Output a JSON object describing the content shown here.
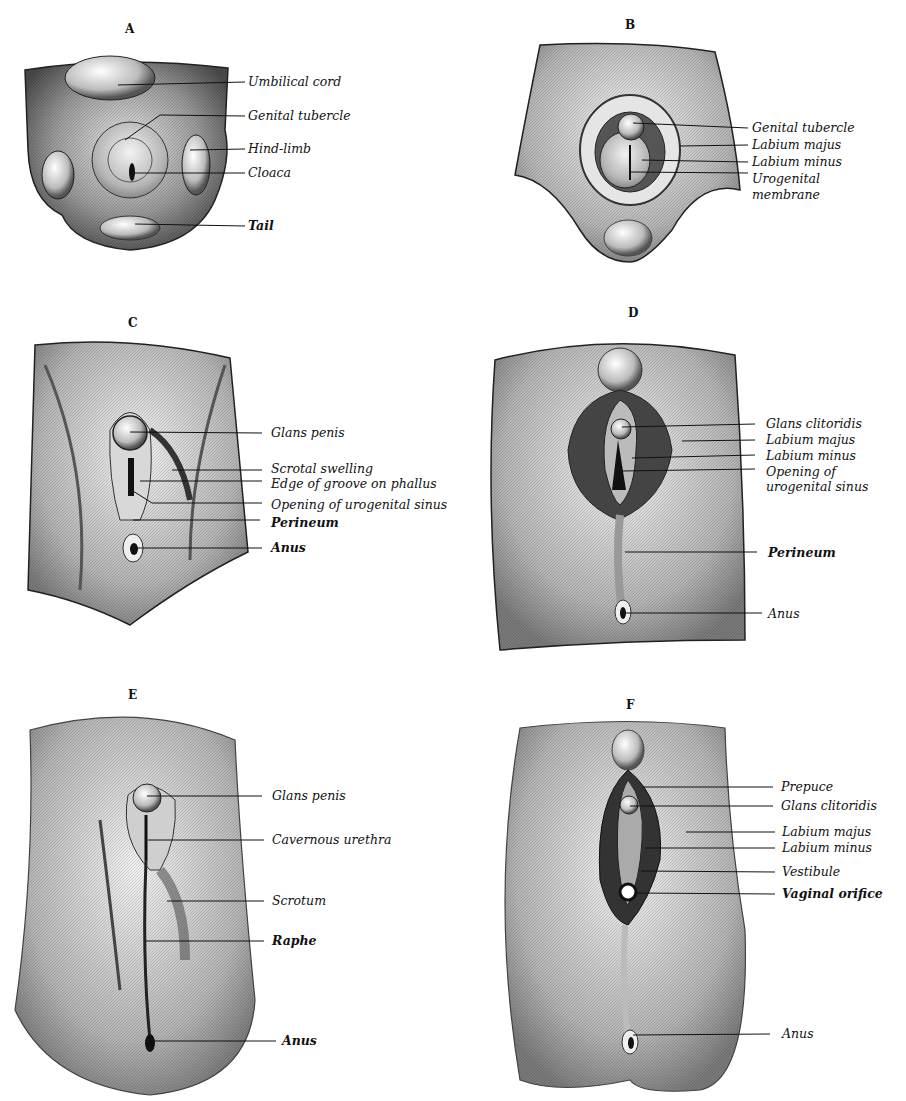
{
  "figure": {
    "panels": [
      {
        "id": "A",
        "letter": "A",
        "labels": [
          "Umbilical cord",
          "Genital tubercle",
          "Hind-limb",
          "Cloaca",
          "Tail"
        ]
      },
      {
        "id": "B",
        "letter": "B",
        "labels": [
          "Genital tubercle",
          "Labium majus",
          "Labium minus",
          "Urogenital",
          "membrane"
        ]
      },
      {
        "id": "C",
        "letter": "C",
        "labels": [
          "Glans penis",
          "Scrotal swelling",
          "Edge of groove on phallus",
          "Opening of urogenital sinus",
          "Perineum",
          "Anus"
        ]
      },
      {
        "id": "D",
        "letter": "D",
        "labels": [
          "Glans clitoridis",
          "Labium majus",
          "Labium minus",
          "Opening of",
          "urogenital sinus",
          "Perineum",
          "Anus"
        ]
      },
      {
        "id": "E",
        "letter": "E",
        "labels": [
          "Glans penis",
          "Cavernous urethra",
          "Scrotum",
          "Raphe",
          "Anus"
        ]
      },
      {
        "id": "F",
        "letter": "F",
        "labels": [
          "Prepuce",
          "Glans clitoridis",
          "Labium majus",
          "Labium minus",
          "Vestibule",
          "Vaginal orifice",
          "Anus"
        ]
      }
    ]
  },
  "colors": {
    "ink": "#111111",
    "paper": "#ffffff",
    "shade_dark": "#3a3a3a",
    "shade_mid": "#8a8a8a",
    "shade_light": "#cfcfcf"
  }
}
